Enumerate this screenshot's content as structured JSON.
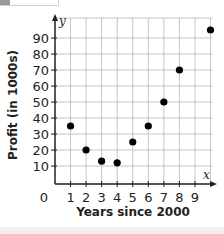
{
  "chart_data": {
    "type": "scatter",
    "title": "",
    "xlabel": "Years since 2000",
    "ylabel": "Profit (in 1000s)",
    "x_axis_letter": "x",
    "y_axis_letter": "y",
    "origin_label": "0",
    "xlim": [
      0,
      10
    ],
    "ylim": [
      0,
      95
    ],
    "grid": true,
    "legend": null,
    "x_ticks": [
      1,
      2,
      3,
      4,
      5,
      6,
      7,
      8,
      9
    ],
    "y_ticks": [
      10,
      20,
      30,
      40,
      50,
      60,
      70,
      80,
      90
    ],
    "points": [
      {
        "x": 1,
        "y": 35
      },
      {
        "x": 2,
        "y": 20
      },
      {
        "x": 3,
        "y": 13
      },
      {
        "x": 4,
        "y": 12
      },
      {
        "x": 5,
        "y": 25
      },
      {
        "x": 6,
        "y": 35
      },
      {
        "x": 7,
        "y": 50
      },
      {
        "x": 8,
        "y": 70
      },
      {
        "x": 10,
        "y": 95
      }
    ],
    "colors": {
      "points": "#000000",
      "axes": "#231f20",
      "grid": "#b8b8b8"
    }
  }
}
